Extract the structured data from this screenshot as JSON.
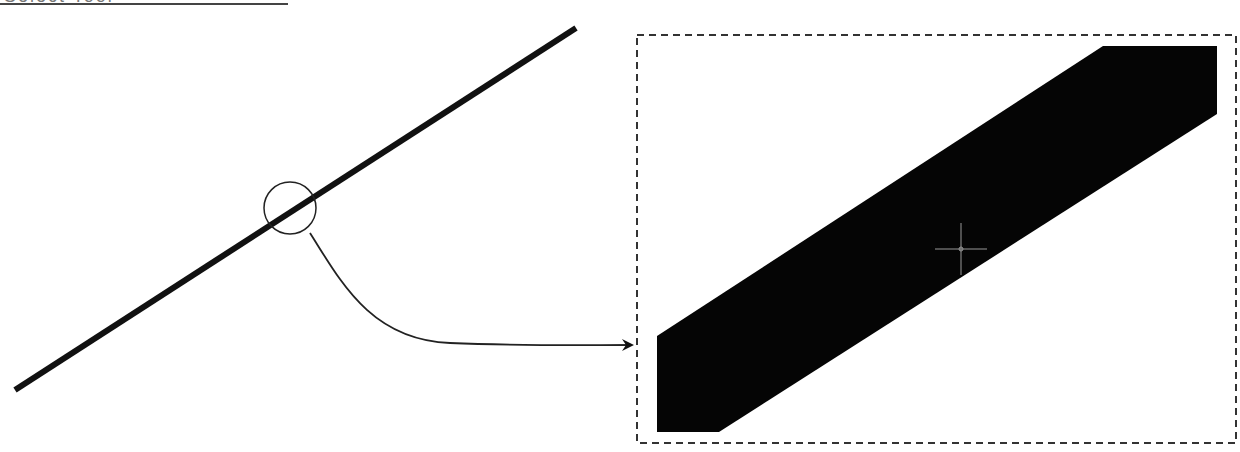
{
  "header": {
    "title_clipped": "Select Tool"
  },
  "diagram": {
    "main_line": {
      "x1": 15,
      "y1": 390,
      "x2": 576,
      "y2": 28,
      "stroke_width": 6,
      "color": "#111111"
    },
    "magnifier_circle": {
      "cx": 290,
      "cy": 208,
      "r": 26,
      "color": "#222222"
    },
    "connector": {
      "from": [
        310,
        233
      ],
      "to": [
        634,
        345
      ],
      "color": "#222222"
    },
    "zoom_frame": {
      "x": 637,
      "y": 35,
      "width": 599,
      "height": 408,
      "style": "dashed",
      "color": "#333333"
    },
    "zoomed_segment": {
      "points": "657,336 1103,46 1217,46 1217,114 719,432 657,432",
      "fill": "#050505"
    },
    "cursor_crosshair": {
      "cx": 961,
      "cy": 249,
      "size": 26,
      "color": "#9a9a9a"
    }
  }
}
